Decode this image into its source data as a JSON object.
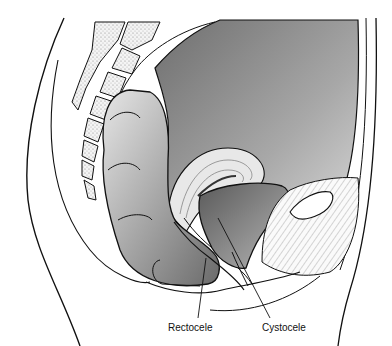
{
  "figure": {
    "labels": {
      "rectocele": "Rectocele",
      "cystocele": "Cystocele"
    },
    "colors": {
      "background": "#ffffff",
      "outline": "#111111",
      "cavity_dark": "#7a7a7a",
      "cavity_light": "#d8d8d8",
      "bone_fill": "#f2f2f2"
    }
  }
}
